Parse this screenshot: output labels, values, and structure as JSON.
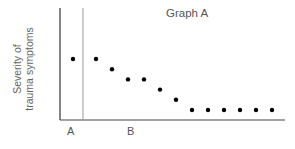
{
  "chart_data": {
    "type": "scatter",
    "title": "Graph A",
    "xlabel": "",
    "ylabel": "Severity of trauma symptoms",
    "ylabel_lines": [
      "Severity of",
      "trauma symptoms"
    ],
    "phases": [
      {
        "label": "A",
        "name": "baseline",
        "points": [
          [
            1,
            6
          ]
        ]
      },
      {
        "label": "B",
        "name": "intervention",
        "points": [
          [
            2,
            6
          ],
          [
            3,
            5
          ],
          [
            4,
            4
          ],
          [
            5,
            4
          ],
          [
            6,
            3
          ],
          [
            7,
            2
          ],
          [
            8,
            1
          ],
          [
            9,
            1
          ],
          [
            10,
            1
          ],
          [
            11,
            1
          ],
          [
            12,
            1
          ],
          [
            13,
            1
          ]
        ]
      }
    ],
    "x": [
      1,
      2,
      3,
      4,
      5,
      6,
      7,
      8,
      9,
      10,
      11,
      12,
      13
    ],
    "values": [
      6,
      6,
      5,
      4,
      4,
      3,
      2,
      1,
      1,
      1,
      1,
      1,
      1
    ],
    "phase_change_after_x": 1,
    "x_tick_labels": [
      "A",
      "B"
    ],
    "y_tick_labels": [],
    "grid": false,
    "legend": null,
    "note": "Values are relative positions; axis has no numeric ticks"
  },
  "labels": {
    "title": "Graph A",
    "ylabel_line1": "Severity of",
    "ylabel_line2": "trauma symptoms",
    "phase_a": "A",
    "phase_b": "B"
  },
  "colors": {
    "axis": "#333333",
    "divider": "#888888",
    "point": "#000000",
    "text": "#555555"
  }
}
